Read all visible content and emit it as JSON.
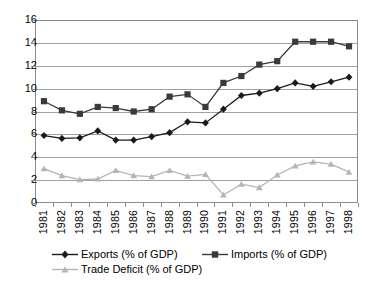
{
  "chart_data": {
    "type": "line",
    "title": "",
    "xlabel": "",
    "ylabel": "",
    "ylim": [
      0,
      16
    ],
    "ytick_step": 2,
    "grid": true,
    "legend_position": "bottom",
    "categories": [
      "1981",
      "1982",
      "1983",
      "1984",
      "1985",
      "1986",
      "1987",
      "1988",
      "1989",
      "1990",
      "1991",
      "1992",
      "1993",
      "1994",
      "1995",
      "1996",
      "1997",
      "1998"
    ],
    "yticks": [
      "0",
      "2",
      "4",
      "6",
      "8",
      "10",
      "12",
      "14",
      "16"
    ],
    "series": [
      {
        "name": "Exports (% of GDP)",
        "marker": "diamond",
        "color": "#1a1a1a",
        "values": [
          5.9,
          5.65,
          5.7,
          6.3,
          5.5,
          5.5,
          5.8,
          6.15,
          7.1,
          7.0,
          8.2,
          9.4,
          9.6,
          10.0,
          10.5,
          10.2,
          10.6,
          11.0
        ]
      },
      {
        "name": "Imports (% of GDP)",
        "marker": "square",
        "color": "#3a3a3a",
        "values": [
          8.9,
          8.1,
          7.8,
          8.4,
          8.3,
          8.0,
          8.2,
          9.3,
          9.5,
          8.4,
          10.5,
          11.1,
          12.1,
          12.4,
          14.1,
          14.1,
          14.1,
          13.7
        ]
      },
      {
        "name": "Trade Deficit (% of GDP)",
        "marker": "triangle",
        "color": "#b5b5b5",
        "values": [
          3.0,
          2.4,
          2.05,
          2.1,
          2.85,
          2.4,
          2.3,
          2.85,
          2.35,
          2.5,
          0.7,
          1.65,
          1.35,
          2.45,
          3.25,
          3.6,
          3.4,
          2.7
        ]
      }
    ]
  },
  "legend": {
    "items": [
      {
        "label": "Exports (% of GDP)",
        "marker": "diamond",
        "color": "#1a1a1a"
      },
      {
        "label": "Imports (% of GDP)",
        "marker": "square",
        "color": "#3a3a3a"
      },
      {
        "label": "Trade Deficit (% of GDP)",
        "marker": "triangle",
        "color": "#b5b5b5"
      }
    ]
  }
}
